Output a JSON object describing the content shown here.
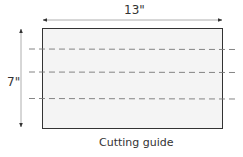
{
  "diagram": {
    "width_label": "13\"",
    "height_label": "7\"",
    "caption": "Cutting guide",
    "colors": {
      "rect_fill": "#f4f4f4",
      "rect_stroke": "#333333",
      "dash": "#777777",
      "arrow": "#333333"
    },
    "cut_lines_count": 3
  }
}
